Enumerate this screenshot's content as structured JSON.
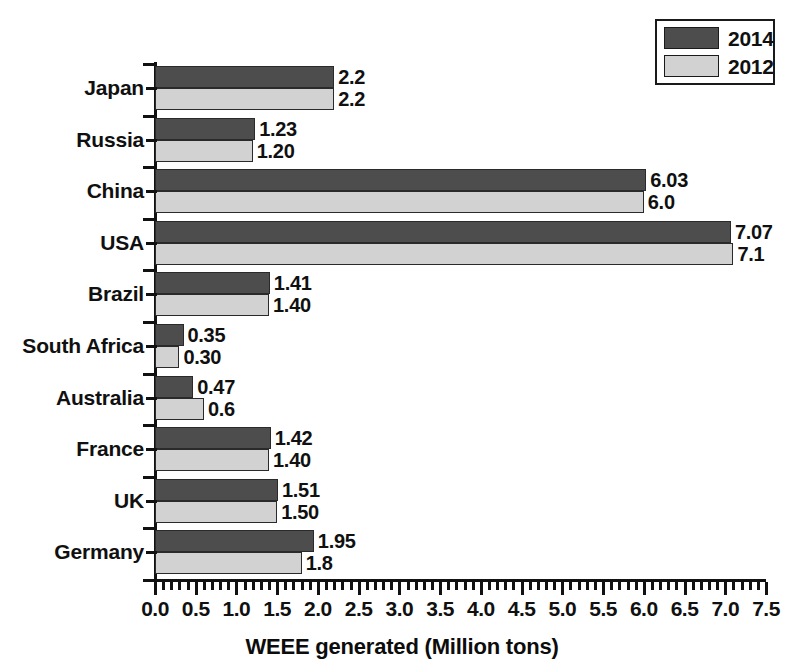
{
  "chart_data": {
    "type": "bar",
    "orientation": "horizontal",
    "title": "",
    "xlabel": "WEEE generated (Million tons)",
    "ylabel": "",
    "xlim": [
      0.0,
      7.5
    ],
    "xticks": [
      "0.0",
      "0.5",
      "1.0",
      "1.5",
      "2.0",
      "2.5",
      "3.0",
      "3.5",
      "4.0",
      "4.5",
      "5.0",
      "5.5",
      "6.0",
      "6.5",
      "7.0",
      "7.5"
    ],
    "xtick_step": 0.5,
    "minor_ticks_per_major": 5,
    "grid": false,
    "legend_position": "top-right",
    "categories": [
      "Japan",
      "Russia",
      "China",
      "USA",
      "Brazil",
      "South Africa",
      "Australia",
      "France",
      "UK",
      "Germany"
    ],
    "series": [
      {
        "name": "2014",
        "color": "#4d4d4d",
        "values": [
          2.2,
          1.23,
          6.03,
          7.07,
          1.41,
          0.35,
          0.47,
          1.42,
          1.51,
          1.95
        ],
        "labels": [
          "2.2",
          "1.23",
          "6.03",
          "7.07",
          "1.41",
          "0.35",
          "0.47",
          "1.42",
          "1.51",
          "1.95"
        ]
      },
      {
        "name": "2012",
        "color": "#d2d2d2",
        "values": [
          2.2,
          1.2,
          6.0,
          7.1,
          1.4,
          0.3,
          0.6,
          1.4,
          1.5,
          1.8
        ],
        "labels": [
          "2.2",
          "1.20",
          "6.0",
          "7.1",
          "1.40",
          "0.30",
          "0.6",
          "1.40",
          "1.50",
          "1.8"
        ]
      }
    ]
  },
  "legend": {
    "entries": [
      {
        "label": "2014",
        "color": "#4d4d4d"
      },
      {
        "label": "2012",
        "color": "#d2d2d2"
      }
    ]
  },
  "axis": {
    "x_title": "WEEE generated (Million tons)"
  }
}
